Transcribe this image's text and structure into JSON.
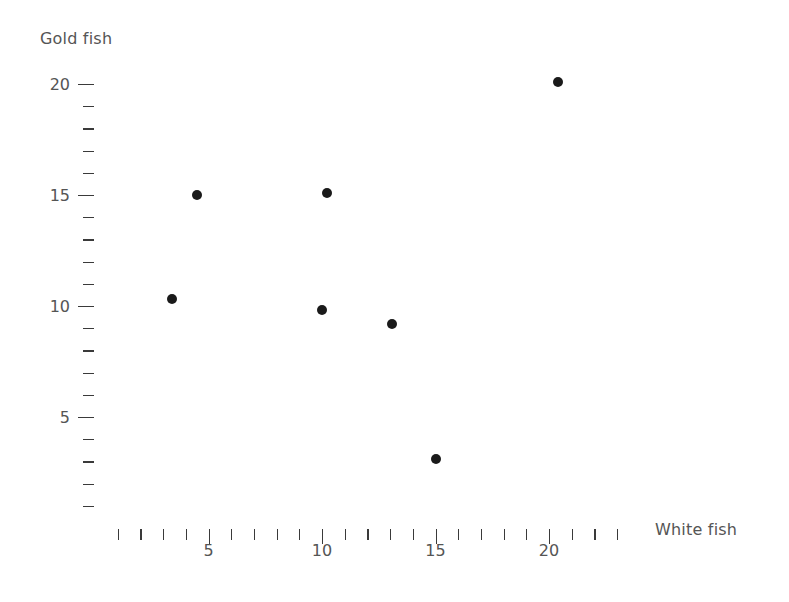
{
  "chart_data": {
    "type": "scatter",
    "title": "",
    "xlabel": "White fish",
    "ylabel": "Gold fish",
    "xlim": [
      0,
      23
    ],
    "ylim": [
      0,
      20.5
    ],
    "grid": false,
    "legend": "none",
    "x_tick_step": 1,
    "y_tick_step": 1,
    "x_major_ticks": [
      5,
      10,
      15,
      20
    ],
    "y_major_ticks": [
      5,
      10,
      15,
      20
    ],
    "x_tick_labels": [
      "5",
      "10",
      "15",
      "20"
    ],
    "y_tick_labels": [
      "5",
      "10",
      "15",
      "20"
    ],
    "point_color": "#1a1a1a",
    "axis_color": "#3a3a3a",
    "text_color": "#555555",
    "points": [
      {
        "x": 3.4,
        "y": 10.3
      },
      {
        "x": 4.5,
        "y": 15.0
      },
      {
        "x": 10.0,
        "y": 9.8
      },
      {
        "x": 10.2,
        "y": 15.1
      },
      {
        "x": 13.1,
        "y": 9.2
      },
      {
        "x": 15.0,
        "y": 3.1
      },
      {
        "x": 20.4,
        "y": 20.1
      }
    ]
  },
  "axes": {
    "y_title": "Gold fish",
    "x_title": "White fish"
  }
}
